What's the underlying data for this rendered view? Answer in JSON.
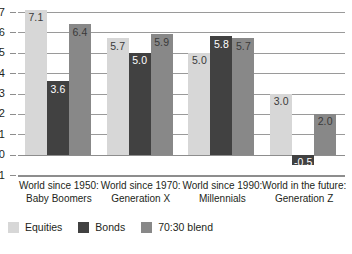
{
  "chart_data": {
    "type": "bar",
    "title": "",
    "subtitle": "",
    "xlabel": "",
    "ylabel": "",
    "ylim": [
      -1,
      7
    ],
    "yticks": [
      "7",
      "6",
      "5",
      "4",
      "3",
      "2",
      "1",
      "0",
      "-1"
    ],
    "grid": true,
    "legend_position": "bottom-left",
    "categories": [
      "World since 1950:\nBaby Boomers",
      "World since 1970:\nGeneration X",
      "World since 1990:\nMillennials",
      "World in the future:\nGeneration Z"
    ],
    "category_lines": [
      [
        "World since 1950:",
        "Baby Boomers"
      ],
      [
        "World since 1970:",
        "Generation X"
      ],
      [
        "World since 1990:",
        "Millennials"
      ],
      [
        "World in the future:",
        "Generation Z"
      ]
    ],
    "series": [
      {
        "name": "Equities",
        "color": "#d7d7d7",
        "values": [
          7.1,
          5.7,
          5.0,
          3.0
        ],
        "labels": [
          "7.1",
          "5.7",
          "5.0",
          "3.0"
        ]
      },
      {
        "name": "Bonds",
        "color": "#414141",
        "values": [
          3.6,
          5.0,
          5.8,
          -0.5
        ],
        "labels": [
          "3.6",
          "5.0",
          "5.8",
          "-0.5"
        ]
      },
      {
        "name": "70:30 blend",
        "color": "#888888",
        "values": [
          6.4,
          5.9,
          5.7,
          2.0
        ],
        "labels": [
          "6.4",
          "5.9",
          "5.7",
          "2.0"
        ]
      }
    ]
  },
  "legend": {
    "items": [
      {
        "label": "Equities",
        "color": "#d7d7d7"
      },
      {
        "label": "Bonds",
        "color": "#414141"
      },
      {
        "label": "70:30 blend",
        "color": "#888888"
      }
    ]
  },
  "axis": {
    "y_tick_labels": [
      "7",
      "6",
      "5",
      "4",
      "3",
      "2",
      "1",
      "0",
      "-1"
    ]
  },
  "colors": {
    "equities": "#d7d7d7",
    "bonds": "#414141",
    "blend": "#888888",
    "grid": "#9a9a9a",
    "text": "#231f20",
    "background": "#ffffff"
  }
}
